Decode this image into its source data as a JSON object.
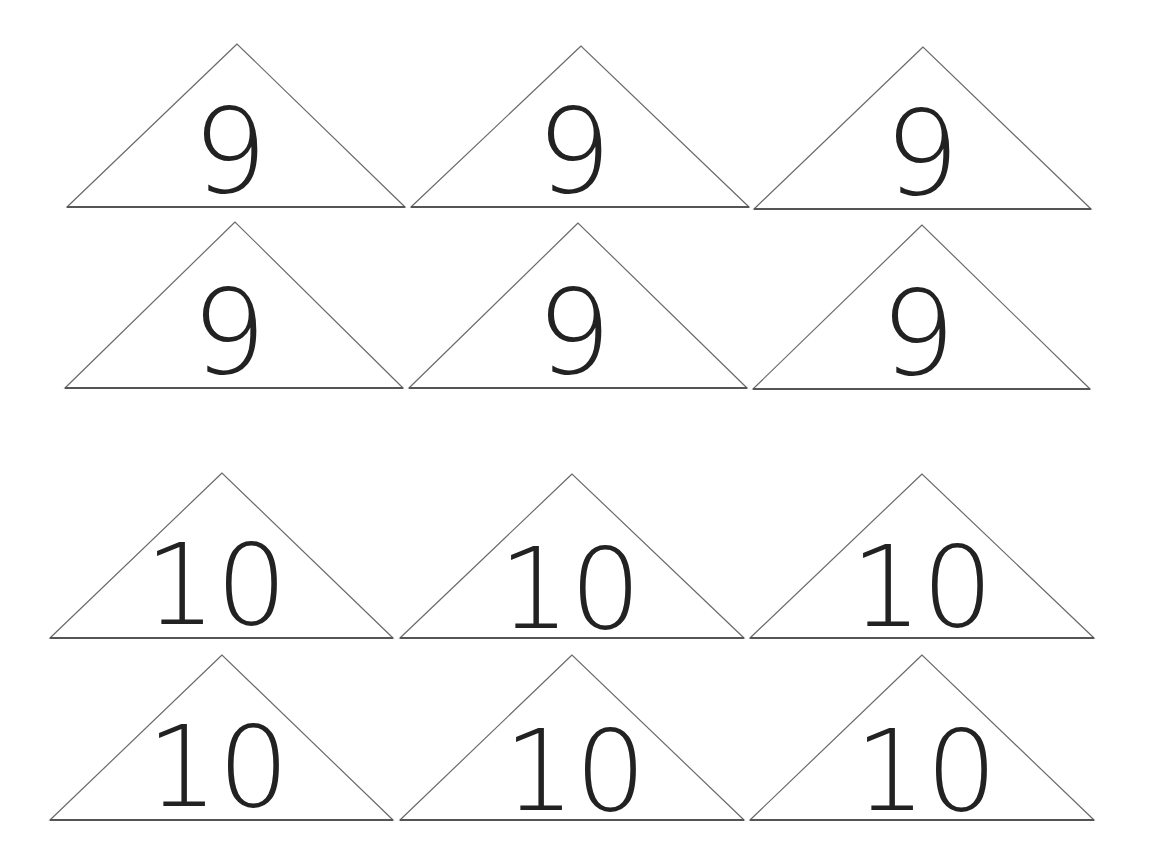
{
  "sheet": {
    "background": "#ffffff",
    "line_color": "#6b6b6b",
    "number_color": "#222222"
  },
  "cards": [
    {
      "label": "9",
      "apex": [
        237,
        44
      ],
      "base_left": [
        67,
        207
      ],
      "base_right": [
        405,
        207
      ],
      "text_x": 230,
      "text_y": 192,
      "font_size": 118
    },
    {
      "label": "9",
      "apex": [
        581,
        46
      ],
      "base_left": [
        411,
        207
      ],
      "base_right": [
        749,
        207
      ],
      "text_x": 574,
      "text_y": 192,
      "font_size": 118
    },
    {
      "label": "9",
      "apex": [
        923,
        47
      ],
      "base_left": [
        754,
        209
      ],
      "base_right": [
        1091,
        209
      ],
      "text_x": 922,
      "text_y": 194,
      "font_size": 118
    },
    {
      "label": "9",
      "apex": [
        235,
        222
      ],
      "base_left": [
        65,
        388
      ],
      "base_right": [
        403,
        388
      ],
      "text_x": 229,
      "text_y": 373,
      "font_size": 118
    },
    {
      "label": "9",
      "apex": [
        578,
        223
      ],
      "base_left": [
        409,
        388
      ],
      "base_right": [
        747,
        388
      ],
      "text_x": 574,
      "text_y": 373,
      "font_size": 118
    },
    {
      "label": "9",
      "apex": [
        922,
        225
      ],
      "base_left": [
        753,
        389
      ],
      "base_right": [
        1090,
        389
      ],
      "text_x": 918,
      "text_y": 374,
      "font_size": 118
    },
    {
      "label": "10",
      "apex": [
        222,
        473
      ],
      "base_left": [
        50,
        638
      ],
      "base_right": [
        393,
        638
      ],
      "text_x": 216,
      "text_y": 624,
      "font_size": 112
    },
    {
      "label": "10",
      "apex": [
        572,
        474
      ],
      "base_left": [
        400,
        638
      ],
      "base_right": [
        744,
        638
      ],
      "text_x": 570,
      "text_y": 628,
      "font_size": 112
    },
    {
      "label": "10",
      "apex": [
        922,
        474
      ],
      "base_left": [
        750,
        638
      ],
      "base_right": [
        1094,
        638
      ],
      "text_x": 922,
      "text_y": 626,
      "font_size": 112
    },
    {
      "label": "10",
      "apex": [
        222,
        655
      ],
      "base_left": [
        50,
        820
      ],
      "base_right": [
        393,
        820
      ],
      "text_x": 218,
      "text_y": 806,
      "font_size": 112
    },
    {
      "label": "10",
      "apex": [
        572,
        655
      ],
      "base_left": [
        400,
        820
      ],
      "base_right": [
        744,
        820
      ],
      "text_x": 575,
      "text_y": 810,
      "font_size": 112
    },
    {
      "label": "10",
      "apex": [
        922,
        655
      ],
      "base_left": [
        750,
        820
      ],
      "base_right": [
        1094,
        820
      ],
      "text_x": 926,
      "text_y": 810,
      "font_size": 112
    }
  ]
}
